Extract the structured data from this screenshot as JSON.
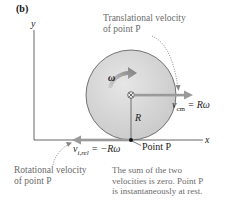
{
  "panel_label": "(b)",
  "axes": {
    "y_label": "y",
    "x_label": "x"
  },
  "omega_label": "ω",
  "radius_label": "R",
  "center_symbol": "⊗",
  "translational": {
    "callout_line1": "Translational velocity",
    "callout_line2": "of point P",
    "eq_v": "v",
    "eq_sub": "cm",
    "eq_rhs": " = Rω"
  },
  "rotational": {
    "callout_line1": "Rotational velocity",
    "callout_line2": "of point P",
    "eq_v": "v",
    "eq_sub": "i,rel",
    "eq_rhs": " = −Rω"
  },
  "point_label": "Point P",
  "summary": {
    "line1": "The sum of the two",
    "line2": "velocities is zero. Point P",
    "line3": "is instantaneously at rest."
  },
  "colors": {
    "disk_fill": "#d4d4d4",
    "disk_stroke": "#555555",
    "velocity_arrow": "#9a9a9a",
    "omega_arrow": "#8a8a8a",
    "axis": "#555555",
    "callout_text": "#6b6b6b"
  }
}
